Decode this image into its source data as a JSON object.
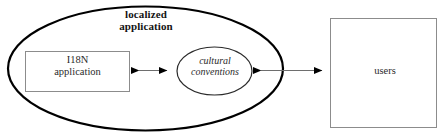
{
  "diagram": {
    "type": "localization-concept-diagram",
    "background_color": "#ffffff",
    "outer_boundary": {
      "shape": "ellipse",
      "label_line1": "localized",
      "label_line2": "application",
      "label_full": "localized application",
      "stroke_color": "#000000",
      "stroke_width": 2.2,
      "fill": "none"
    },
    "nodes": [
      {
        "id": "i18n-application",
        "shape": "rectangle",
        "label_line1": "I18N",
        "label_line2": "application",
        "label_full": "I18N application",
        "stroke_color": "#8c8c8c",
        "fill": "#ffffff",
        "inside_boundary": true
      },
      {
        "id": "cultural-conventions",
        "shape": "ellipse",
        "label_line1": "cultural",
        "label_line2": "conventions",
        "label_full": "cultural conventions",
        "stroke_color": "#2b2b2b",
        "fill": "#ffffff",
        "font_style": "italic",
        "inside_boundary": true
      },
      {
        "id": "users",
        "shape": "rectangle",
        "label_line1": "users",
        "label_full": "users",
        "stroke_color": "#8c8c8c",
        "fill": "#ffffff",
        "inside_boundary": false
      }
    ],
    "connectors": [
      {
        "id": "i18n-to-cultural",
        "from": "i18n-application",
        "to": "cultural-conventions",
        "arrowheads": "both",
        "line_color": "#6e6e6e",
        "arrow_color": "#000000"
      },
      {
        "id": "cultural-to-users",
        "from": "cultural-conventions",
        "to": "users",
        "arrowheads": "both",
        "line_color": "#6e6e6e",
        "arrow_color": "#000000",
        "crosses_boundary": true
      }
    ]
  }
}
